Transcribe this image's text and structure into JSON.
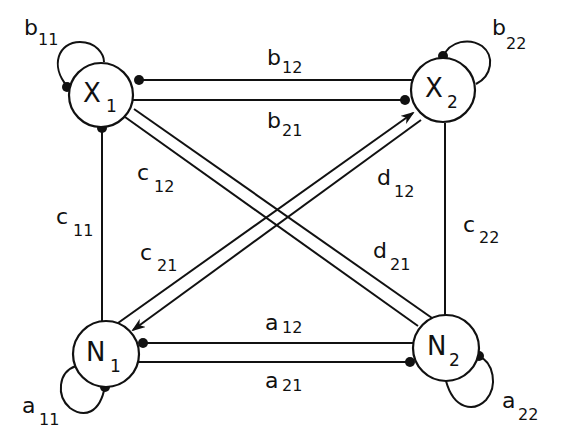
{
  "diagram": {
    "type": "interaction graph",
    "nodes": [
      {
        "id": "X1",
        "letter": "X",
        "sub": "1",
        "cx": 101,
        "cy": 95
      },
      {
        "id": "X2",
        "letter": "X",
        "sub": "2",
        "cx": 443,
        "cy": 90
      },
      {
        "id": "N1",
        "letter": "N",
        "sub": "1",
        "cx": 106,
        "cy": 354
      },
      {
        "id": "N2",
        "letter": "N",
        "sub": "2",
        "cx": 446,
        "cy": 348
      }
    ],
    "self_loops": [
      {
        "node": "X1",
        "letter": "b",
        "sub": "11"
      },
      {
        "node": "X2",
        "letter": "b",
        "sub": "22"
      },
      {
        "node": "N1",
        "letter": "a",
        "sub": "11"
      },
      {
        "node": "N2",
        "letter": "a",
        "sub": "22"
      }
    ],
    "edges": [
      {
        "from": "X2",
        "to": "X1",
        "letter": "b",
        "sub": "12",
        "end": "dot"
      },
      {
        "from": "X1",
        "to": "X2",
        "letter": "b",
        "sub": "21",
        "end": "dot"
      },
      {
        "from": "N2",
        "to": "N1",
        "letter": "a",
        "sub": "12",
        "end": "dot"
      },
      {
        "from": "N1",
        "to": "N2",
        "letter": "a",
        "sub": "21",
        "end": "dot"
      },
      {
        "from": "N1",
        "to": "X1",
        "letter": "c",
        "sub": "11",
        "end": "dot"
      },
      {
        "from": "X1",
        "to": "N2",
        "letter": "c",
        "sub": "12",
        "end": "none"
      },
      {
        "from": "X2",
        "to": "N1",
        "letter": "c",
        "sub": "21",
        "end": "arrow"
      },
      {
        "from": "N2",
        "to": "X2",
        "letter": "c",
        "sub": "22",
        "end": "none"
      },
      {
        "from": "N1",
        "to": "X2",
        "letter": "d",
        "sub": "12",
        "end": "arrow"
      },
      {
        "from": "X1",
        "to": "N2",
        "letter": "d",
        "sub": "21",
        "end": "none"
      }
    ]
  },
  "labels": {
    "X1": {
      "letter": "X",
      "sub": "1"
    },
    "X2": {
      "letter": "X",
      "sub": "2"
    },
    "N1": {
      "letter": "N",
      "sub": "1"
    },
    "N2": {
      "letter": "N",
      "sub": "2"
    },
    "b11": {
      "letter": "b",
      "sub": "11"
    },
    "b22": {
      "letter": "b",
      "sub": "22"
    },
    "b12": {
      "letter": "b",
      "sub": "12"
    },
    "b21": {
      "letter": "b",
      "sub": "21"
    },
    "c11": {
      "letter": "c",
      "sub": "11"
    },
    "c12": {
      "letter": "c",
      "sub": "12"
    },
    "c21": {
      "letter": "c",
      "sub": "21"
    },
    "c22": {
      "letter": "c",
      "sub": "22"
    },
    "d12": {
      "letter": "d",
      "sub": "12"
    },
    "d21": {
      "letter": "d",
      "sub": "21"
    },
    "a12": {
      "letter": "a",
      "sub": "12"
    },
    "a21": {
      "letter": "a",
      "sub": "21"
    },
    "a11": {
      "letter": "a",
      "sub": "11"
    },
    "a22": {
      "letter": "a",
      "sub": "22"
    }
  },
  "colors": {
    "ink": "#111111",
    "background": "#ffffff"
  }
}
